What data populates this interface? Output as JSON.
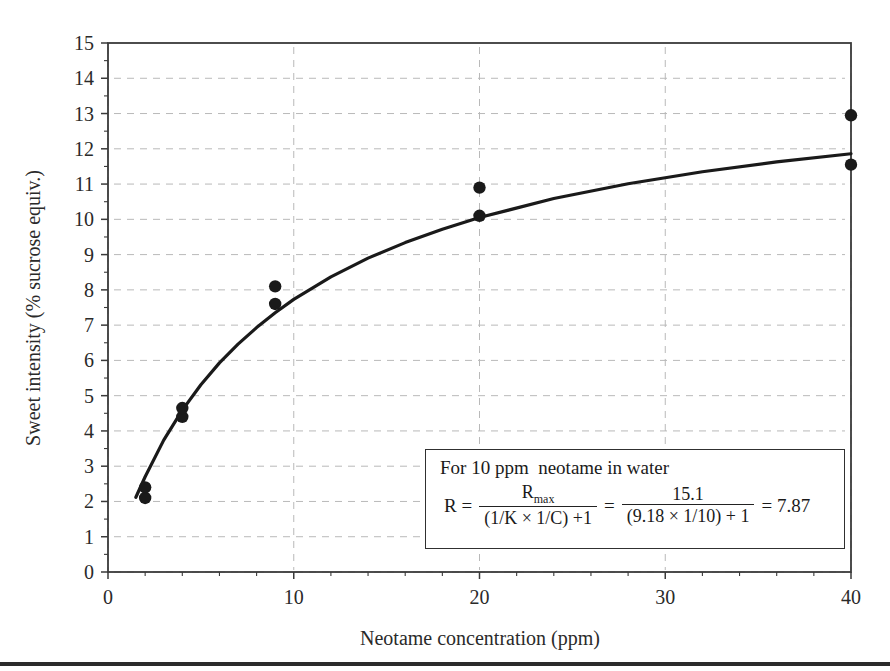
{
  "chart_data": {
    "type": "scatter",
    "title": "",
    "xlabel": "Neotame concentration (ppm)",
    "ylabel": "Sweet intensity (% sucrose equiv.)",
    "xlim": [
      0,
      40
    ],
    "ylim": [
      0,
      15
    ],
    "xticks": [
      0,
      10,
      20,
      30,
      40
    ],
    "xtick_labels": [
      "0",
      "10",
      "20",
      "30",
      "40"
    ],
    "xminor_step": 2,
    "yticks": [
      0,
      1,
      2,
      3,
      4,
      5,
      6,
      7,
      8,
      9,
      10,
      11,
      12,
      13,
      14,
      15
    ],
    "ytick_labels": [
      "0",
      "1",
      "2",
      "3",
      "4",
      "5",
      "6",
      "7",
      "8",
      "9",
      "10",
      "11",
      "12",
      "13",
      "14",
      "15"
    ],
    "grid": true,
    "grid_style": "dashed",
    "legend": "none",
    "series": [
      {
        "name": "Observed sweet intensity",
        "type": "scatter",
        "marker": "filled-circle",
        "color": "#1a1a1a",
        "points": [
          {
            "x": 2,
            "y": 2.1
          },
          {
            "x": 2,
            "y": 2.4
          },
          {
            "x": 4,
            "y": 4.4
          },
          {
            "x": 4,
            "y": 4.65
          },
          {
            "x": 9,
            "y": 7.6
          },
          {
            "x": 9,
            "y": 8.1
          },
          {
            "x": 20,
            "y": 10.1
          },
          {
            "x": 20,
            "y": 10.9
          },
          {
            "x": 40,
            "y": 11.55
          },
          {
            "x": 40,
            "y": 12.95
          }
        ]
      },
      {
        "name": "Fitted hyperbolic curve",
        "type": "line",
        "color": "#1a1a1a",
        "model": "R = Rmax / ((1/K x 1/C) + 1)",
        "Rmax": 15.1,
        "K": 9.18,
        "x": [
          1.5,
          2,
          3,
          4,
          5,
          6,
          7,
          8,
          9,
          10,
          12,
          14,
          16,
          18,
          20,
          24,
          28,
          32,
          36,
          40
        ],
        "y": [
          2.12,
          2.7,
          3.74,
          4.59,
          5.31,
          5.93,
          6.46,
          6.93,
          7.35,
          7.73,
          8.37,
          8.9,
          9.34,
          9.72,
          10.05,
          10.59,
          11.01,
          11.35,
          11.63,
          11.86
        ]
      }
    ]
  },
  "annotation_box": {
    "line1": "For 10 ppm  neotame in water",
    "equation": {
      "lhs": "R = ",
      "frac1_num": "R",
      "frac1_num_sub": "max",
      "frac1_den": "(1/K × 1/C) +1",
      "eq_mid": "=",
      "frac2_num": "15.1",
      "frac2_den": "(9.18 × 1/10) + 1",
      "result": "= 7.87"
    }
  },
  "colors": {
    "axis": "#3a3a3a",
    "grid": "#b9b9b9",
    "marker": "#151515",
    "curve": "#1a1a1a",
    "rule": "#2b2b2b",
    "background": "#ffffff"
  }
}
